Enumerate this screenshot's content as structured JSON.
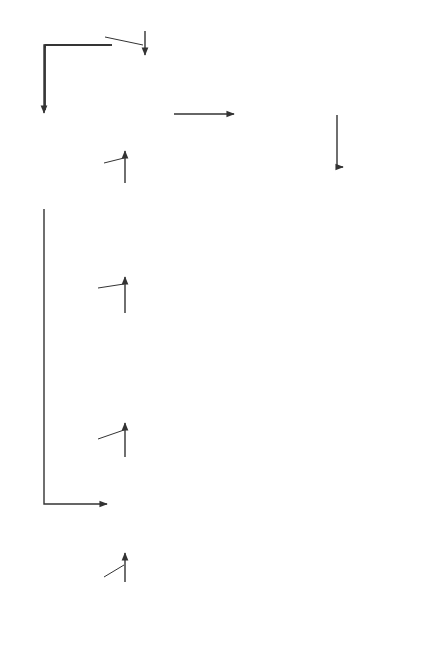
{
  "nodes": {
    "historical_data": "Historical\nData",
    "simulation_model": "Simulation or\nModel of a\nGiven Business\nEnterprise\nor Specific\nProblem",
    "simulation_tag": "Simulation",
    "initial_predictions": "(Initial) Set of\nPredictions for Various\nPossibilities with Results\nof Selecting Any\nAlternative",
    "management_decision": "Management\nDecision-\nSelection\nof a Strategy\nwith Full\nKnowledge of\nPredicted Result",
    "production_statements": "Production of\nNecessary\nIndustrial and\nGovernment\nStatements",
    "comparison": "Comparison of\nActual Operating\nResults with\nThose Predicted\nby Simulation",
    "actual_operating_results": "Actual\nOperating\nResults",
    "deviations": "Deviations\nbetween\nPredicted and\nActual\nResults",
    "management_analysis": "Management Analysis\nof Deviations\nto Determine if\nDeviations are\nMeaningful or\nMerely Reflect\nSome Special and\nTemporary Condition",
    "management_by_exception": "Management\nby Exception"
  },
  "edge_labels": {
    "reduced_summaries_historical": "Reduced to\nMeaningful\nSummaries",
    "produces_predictions": "Produces Predictions",
    "use_updated_history": "Use as Updated History",
    "review_by_management_1": "Review by Management",
    "implementation_of_decision": "Implementation of\nDecision",
    "produce_periodic_reports": "Produce Periodic Reports",
    "reduced_summaries_actual": "Reduced to\nMeaningful\nSummaries",
    "produce_exceptions": "Produce Exceptions",
    "review_by_management_2": "Review by Management",
    "use_data_on_exceptions": "Use Data on Exceptions\nto Improve Summation"
  },
  "colors": {
    "line": "#333333",
    "border": "#444444",
    "background": "#ffffff"
  }
}
